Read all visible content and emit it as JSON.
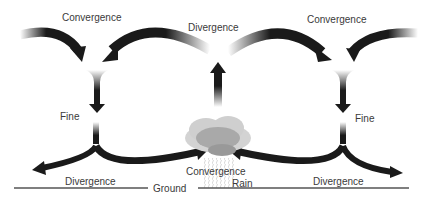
{
  "diagram": {
    "labels": {
      "convergence_top_left": "Convergence",
      "divergence_top": "Divergence",
      "convergence_top_right": "Convergence",
      "fine_left": "Fine",
      "fine_right": "Fine",
      "divergence_bottom_left": "Divergence",
      "convergence_bottom": "Convergence",
      "divergence_bottom_right": "Divergence",
      "ground": "Ground",
      "rain": "Rain"
    },
    "colors": {
      "arrow": "#1a1a1a",
      "ground_line": "#555555",
      "cloud_outer": "#cfcfcf",
      "cloud_inner": "#a9a9a9",
      "text": "#3a3a3a"
    }
  }
}
